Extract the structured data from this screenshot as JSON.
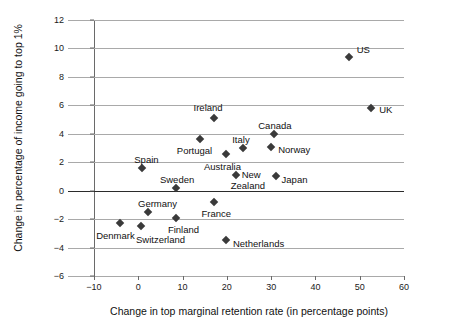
{
  "chart_data": {
    "type": "scatter",
    "title": "",
    "xlabel": "Change in top marginal retention rate (in percentage points)",
    "ylabel": "Change in percentage of income going to top 1%",
    "xlim": [
      -10,
      60
    ],
    "ylim": [
      -6,
      12
    ],
    "xticks": [
      -10,
      0,
      10,
      20,
      30,
      40,
      50,
      60
    ],
    "yticks": [
      -6,
      -4,
      -2,
      0,
      2,
      4,
      6,
      8,
      10,
      12
    ],
    "grid": "horizontal",
    "legend": "none",
    "marker": "diamond",
    "marker_color": "#3a3a3a",
    "points": [
      {
        "label": "US",
        "x": 47.5,
        "y": 9.4,
        "lx": 8,
        "ly": -13
      },
      {
        "label": "UK",
        "x": 52.6,
        "y": 5.8,
        "lx": 8,
        "ly": -4
      },
      {
        "label": "Ireland",
        "x": 17.0,
        "y": 5.1,
        "lx": -20,
        "ly": -16
      },
      {
        "label": "Canada",
        "x": 30.7,
        "y": 4.0,
        "lx": -16,
        "ly": -14
      },
      {
        "label": "Portugal",
        "x": 13.9,
        "y": 3.6,
        "lx": -23,
        "ly": 6
      },
      {
        "label": "Norway",
        "x": 30.0,
        "y": 3.1,
        "lx": 7,
        "ly": -3
      },
      {
        "label": "Italy",
        "x": 23.7,
        "y": 3.0,
        "lx": -11,
        "ly": -14
      },
      {
        "label": "Australia",
        "x": 19.8,
        "y": 2.6,
        "lx": -22,
        "ly": 7
      },
      {
        "label": "Spain",
        "x": 0.9,
        "y": 1.6,
        "lx": -8,
        "ly": -14
      },
      {
        "label": "New",
        "x": 22.0,
        "y": 1.1,
        "lx": 6,
        "ly": -6
      },
      {
        "label": "Zealand",
        "x": 22.0,
        "y": 1.1,
        "lx": -5,
        "ly": 5,
        "nomarker": true
      },
      {
        "label": "Japan",
        "x": 31.0,
        "y": 1.0,
        "lx": 6,
        "ly": -2
      },
      {
        "label": "Sweden",
        "x": 8.5,
        "y": 0.2,
        "lx": -16,
        "ly": -14
      },
      {
        "label": "France",
        "x": 17.0,
        "y": -0.8,
        "lx": -12,
        "ly": 6
      },
      {
        "label": "Germany",
        "x": 2.2,
        "y": -1.5,
        "lx": -10,
        "ly": -14
      },
      {
        "label": "Finland",
        "x": 8.5,
        "y": -1.9,
        "lx": -8,
        "ly": 6
      },
      {
        "label": "Denmark",
        "x": -4.1,
        "y": -2.3,
        "lx": -24,
        "ly": 7
      },
      {
        "label": "Switzerland",
        "x": 0.6,
        "y": -2.5,
        "lx": -5,
        "ly": 8
      },
      {
        "label": "Netherlands",
        "x": 19.8,
        "y": -3.5,
        "lx": 7,
        "ly": -2
      }
    ]
  }
}
